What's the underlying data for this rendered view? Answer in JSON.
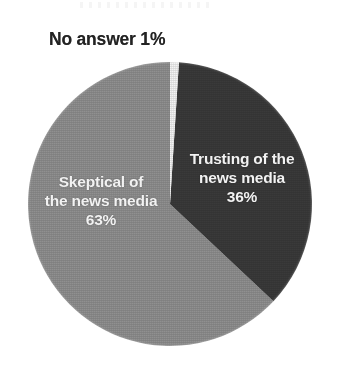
{
  "page": {
    "background_color": "#ffffff",
    "width": 343,
    "height": 378
  },
  "chart_data": {
    "type": "pie",
    "title": "",
    "subtitle": "",
    "xlabel": "",
    "ylabel": "",
    "legend_position": "none",
    "grid": false,
    "categories": [
      "Trusting of the news media",
      "Skeptical of the news media",
      "No answer"
    ],
    "values": [
      36,
      63,
      1
    ],
    "value_labels": [
      "36%",
      "63%",
      "1%"
    ],
    "colors": [
      "#3a3a3a",
      "#909090",
      "#f4f4f4"
    ],
    "units": "percent",
    "start_angle_deg": 0,
    "direction": "clockwise",
    "slices": [
      {
        "name": "Trusting of the news media",
        "label_line_1": "Trusting of the",
        "label_line_2": "news media",
        "value": 36,
        "value_label": "36%",
        "color": "#3a3a3a",
        "label_color": "#f2f2f2",
        "label_placement": "inside"
      },
      {
        "name": "Skeptical of the news media",
        "label_line_1": "Skeptical of",
        "label_line_2": "the news media",
        "value": 63,
        "value_label": "63%",
        "color": "#909090",
        "label_color": "#f2f2f2",
        "label_placement": "inside"
      },
      {
        "name": "No answer",
        "label_line_1": "No answer 1%",
        "label_line_2": "",
        "value": 1,
        "value_label": "1%",
        "color": "#f4f4f4",
        "label_color": "#232323",
        "label_placement": "outside"
      }
    ]
  },
  "labels": {
    "no_answer_callout": "No answer 1%",
    "trusting": {
      "line1": "Trusting of the",
      "line2": "news media",
      "value": "36%"
    },
    "skeptical": {
      "line1": "Skeptical of",
      "line2": "the news media",
      "value": "63%"
    }
  }
}
